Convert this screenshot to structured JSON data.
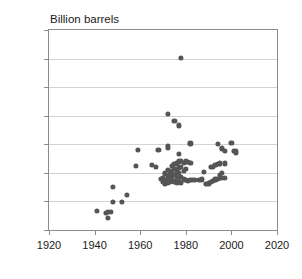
{
  "chart_data": {
    "type": "scatter",
    "title": "Billion barrels",
    "xlabel": "",
    "ylabel": "",
    "xlim": [
      1920,
      2020
    ],
    "ylim": [
      0,
      7000
    ],
    "xticks": [
      1920,
      1940,
      1960,
      1980,
      2000,
      2020
    ],
    "yticks": [
      0,
      1000,
      2000,
      3000,
      4000,
      5000,
      6000,
      7000
    ],
    "grid": true,
    "legend": null,
    "marker_color": "#555555",
    "frame_color": "#8c8c8c",
    "gridline_color": "#d2d2d2",
    "points": [
      {
        "x": 1941,
        "y": 680
      },
      {
        "x": 1945,
        "y": 600
      },
      {
        "x": 1946,
        "y": 430
      },
      {
        "x": 1946,
        "y": 620
      },
      {
        "x": 1947,
        "y": 620
      },
      {
        "x": 1948,
        "y": 990
      },
      {
        "x": 1948,
        "y": 1500
      },
      {
        "x": 1952,
        "y": 990
      },
      {
        "x": 1954,
        "y": 1230
      },
      {
        "x": 1958,
        "y": 2250
      },
      {
        "x": 1959,
        "y": 2800
      },
      {
        "x": 1965,
        "y": 2280
      },
      {
        "x": 1967,
        "y": 2200
      },
      {
        "x": 1968,
        "y": 2800
      },
      {
        "x": 1969,
        "y": 1790
      },
      {
        "x": 1970,
        "y": 1830
      },
      {
        "x": 1970,
        "y": 1700
      },
      {
        "x": 1971,
        "y": 1760
      },
      {
        "x": 1971,
        "y": 1980
      },
      {
        "x": 1971,
        "y": 1600
      },
      {
        "x": 1972,
        "y": 4050
      },
      {
        "x": 1972,
        "y": 2950
      },
      {
        "x": 1972,
        "y": 2870
      },
      {
        "x": 1972,
        "y": 2090
      },
      {
        "x": 1972,
        "y": 1900
      },
      {
        "x": 1972,
        "y": 1780
      },
      {
        "x": 1972,
        "y": 1650
      },
      {
        "x": 1973,
        "y": 2060
      },
      {
        "x": 1973,
        "y": 1950
      },
      {
        "x": 1973,
        "y": 1820
      },
      {
        "x": 1973,
        "y": 1700
      },
      {
        "x": 1974,
        "y": 2230
      },
      {
        "x": 1974,
        "y": 2000
      },
      {
        "x": 1974,
        "y": 1880
      },
      {
        "x": 1974,
        "y": 1750
      },
      {
        "x": 1975,
        "y": 3830
      },
      {
        "x": 1975,
        "y": 2300
      },
      {
        "x": 1975,
        "y": 2150
      },
      {
        "x": 1975,
        "y": 1930
      },
      {
        "x": 1975,
        "y": 1700
      },
      {
        "x": 1976,
        "y": 2330
      },
      {
        "x": 1976,
        "y": 2070
      },
      {
        "x": 1976,
        "y": 1850
      },
      {
        "x": 1976,
        "y": 1640
      },
      {
        "x": 1977,
        "y": 3660
      },
      {
        "x": 1977,
        "y": 2650
      },
      {
        "x": 1977,
        "y": 2400
      },
      {
        "x": 1977,
        "y": 2180
      },
      {
        "x": 1977,
        "y": 1990
      },
      {
        "x": 1977,
        "y": 1700
      },
      {
        "x": 1978,
        "y": 6020
      },
      {
        "x": 1978,
        "y": 2420
      },
      {
        "x": 1978,
        "y": 2200
      },
      {
        "x": 1978,
        "y": 1870
      },
      {
        "x": 1978,
        "y": 1650
      },
      {
        "x": 1979,
        "y": 2350
      },
      {
        "x": 1979,
        "y": 2080
      },
      {
        "x": 1979,
        "y": 1770
      },
      {
        "x": 1980,
        "y": 2400
      },
      {
        "x": 1980,
        "y": 2130
      },
      {
        "x": 1980,
        "y": 1760
      },
      {
        "x": 1981,
        "y": 2390
      },
      {
        "x": 1981,
        "y": 1730
      },
      {
        "x": 1982,
        "y": 3030
      },
      {
        "x": 1982,
        "y": 2350
      },
      {
        "x": 1982,
        "y": 1760
      },
      {
        "x": 1983,
        "y": 1760
      },
      {
        "x": 1984,
        "y": 1740
      },
      {
        "x": 1986,
        "y": 1750
      },
      {
        "x": 1987,
        "y": 1770
      },
      {
        "x": 1988,
        "y": 2040
      },
      {
        "x": 1989,
        "y": 1600
      },
      {
        "x": 1990,
        "y": 1630
      },
      {
        "x": 1991,
        "y": 2210
      },
      {
        "x": 1991,
        "y": 1690
      },
      {
        "x": 1992,
        "y": 2220
      },
      {
        "x": 1992,
        "y": 1720
      },
      {
        "x": 1993,
        "y": 2290
      },
      {
        "x": 1993,
        "y": 1770
      },
      {
        "x": 1994,
        "y": 3020
      },
      {
        "x": 1994,
        "y": 2320
      },
      {
        "x": 1994,
        "y": 1790
      },
      {
        "x": 1995,
        "y": 2330
      },
      {
        "x": 1995,
        "y": 1930
      },
      {
        "x": 1995,
        "y": 1810
      },
      {
        "x": 1996,
        "y": 2870
      },
      {
        "x": 1996,
        "y": 2830
      },
      {
        "x": 1996,
        "y": 1990
      },
      {
        "x": 1996,
        "y": 1820
      },
      {
        "x": 1997,
        "y": 2760
      },
      {
        "x": 1997,
        "y": 2330
      },
      {
        "x": 1997,
        "y": 1830
      },
      {
        "x": 2000,
        "y": 3050
      },
      {
        "x": 2001,
        "y": 2770
      },
      {
        "x": 2002,
        "y": 2750
      },
      {
        "x": 2002,
        "y": 2690
      }
    ]
  }
}
